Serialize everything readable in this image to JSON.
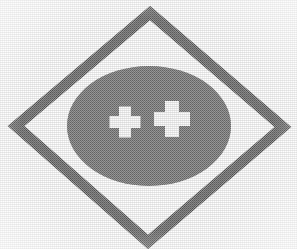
{
  "image": {
    "kind": "logo-mark",
    "description": "Scanned monochrome halftone logo: gray diamond outline enclosing a gray ellipse bearing two white cross symbols",
    "width": 297,
    "height": 249,
    "background_color": "#fefefe"
  },
  "palette": {
    "background": "#fefefe",
    "diamond_stroke": "#7c7c7c",
    "diamond_stroke_light": "#9a9a9a",
    "ellipse_fill": "#8a8a8a",
    "ellipse_fill_light": "#9c9c9c",
    "cross_fill": "#fbfbfb",
    "ink": "#6f6f6f"
  },
  "diamond": {
    "name": "diamond-outline",
    "points": "150,13 283,127 148,242 16,126",
    "stroke_width": 11,
    "fill": "none"
  },
  "ellipse": {
    "name": "halftone-ellipse",
    "cx": 149,
    "cy": 126,
    "rx": 82,
    "ry": 60
  },
  "crosses": [
    {
      "name": "cross-left",
      "label": "plus",
      "cx": 125,
      "cy": 122,
      "arm_length": 31,
      "arm_width": 12,
      "rotation": 0
    },
    {
      "name": "cross-right",
      "label": "plus",
      "cx": 172,
      "cy": 119,
      "arm_length": 36,
      "arm_width": 14,
      "rotation": 0
    }
  ]
}
